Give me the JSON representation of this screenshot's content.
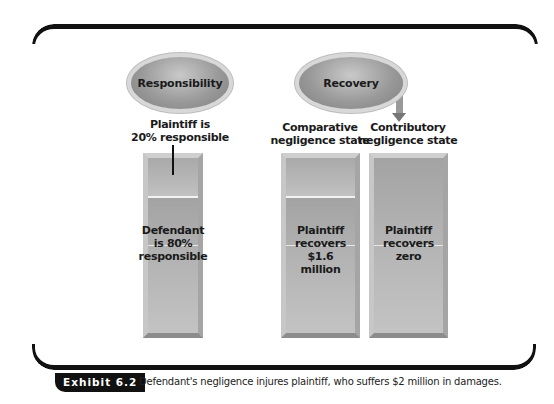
{
  "left_panel": {
    "header": "Responsibility",
    "plaintiff_label_line1": "Plaintiff is",
    "plaintiff_label_line2": "20% responsible",
    "bar_text_line1": "Defendant",
    "bar_text_line2": "is 80%",
    "bar_text_line3": "responsible"
  },
  "right_panel": {
    "header": "Recovery",
    "comparative": {
      "label_line1": "Comparative",
      "label_line2": "negligence state",
      "bar_text_line1": "Plaintiff",
      "bar_text_line2": "recovers",
      "bar_text_line3": "$1.6 million"
    },
    "contributory": {
      "label_line1": "Contributory",
      "label_line2": "negligence state",
      "bar_text_line1": "Plaintiff",
      "bar_text_line2": "recovers",
      "bar_text_line3": "zero"
    }
  },
  "caption": {
    "badge": "Exhibit 6.2",
    "text": "Defendant's negligence injures plaintiff, who suffers $2 million in damages."
  },
  "colors": {
    "frame": "#111111",
    "bar_fill": "#b0b0b0",
    "ellipse_fill": "#9a9a9a",
    "badge_bg": "#111111"
  }
}
